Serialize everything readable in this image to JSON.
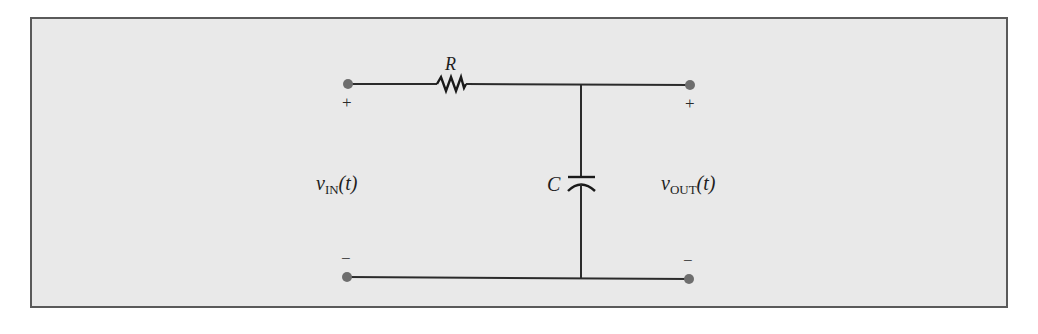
{
  "diagram": {
    "colors": {
      "background": "#e9e9e9",
      "border": "#5a5a5a",
      "wire": "#2b2b2b",
      "terminal": "#6e6e6e",
      "text": "#1e1e1e"
    },
    "components": {
      "resistor": {
        "label": "R"
      },
      "capacitor": {
        "label": "C"
      }
    },
    "input": {
      "voltage_symbol": "v",
      "voltage_subscript": "IN",
      "voltage_arg": "(t)",
      "plus": "+",
      "minus": "−"
    },
    "output": {
      "voltage_symbol": "v",
      "voltage_subscript": "OUT",
      "voltage_arg": "(t)",
      "plus": "+",
      "minus": "−"
    }
  }
}
